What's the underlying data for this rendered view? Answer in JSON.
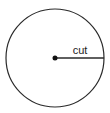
{
  "diagram": {
    "type": "circle-with-radius",
    "label": "cut",
    "colors": {
      "stroke": "#2a2a2a",
      "background": "#ffffff",
      "text": "#222222"
    },
    "circle": {
      "cx": 55,
      "cy": 58,
      "r": 49
    },
    "center_dot": {
      "cx": 55,
      "cy": 58,
      "r": 2.5
    },
    "radius_line": {
      "x1": 55,
      "y1": 58,
      "x2": 104,
      "y2": 58
    },
    "label_position": {
      "x": 80,
      "y": 54
    }
  }
}
